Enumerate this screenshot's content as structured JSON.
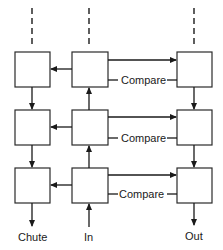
{
  "diagram": {
    "labels": {
      "compare_row1": "Compare",
      "compare_row2": "Compare",
      "compare_row3": "Compare",
      "chute": "Chute",
      "in": "In",
      "out": "Out"
    },
    "columns": [
      "chute-column",
      "in-column",
      "out-column"
    ],
    "rows": 3,
    "colors": {
      "stroke": "#1a1a1a",
      "background": "#ffffff"
    }
  }
}
